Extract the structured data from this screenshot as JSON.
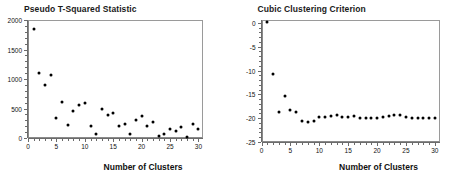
{
  "chart_data": [
    {
      "type": "scatter",
      "panel_id": "pseudo-t-squared",
      "title": "Pseudo T-Squared Statistic",
      "xlabel": "Number of Clusters",
      "ylabel": "",
      "xlim": [
        0,
        30.8
      ],
      "ylim": [
        0,
        2000
      ],
      "xticks": [
        0,
        5,
        10,
        15,
        20,
        25,
        30
      ],
      "xticklabels": [
        "0",
        "5",
        "10",
        "15",
        "20",
        "25",
        "30"
      ],
      "yticks": [
        0,
        500,
        1000,
        1500,
        2000
      ],
      "yticklabels": [
        "0",
        "500",
        "1000",
        "1500",
        "2000"
      ],
      "grid": false,
      "legend": "none",
      "x": [
        1,
        2,
        3,
        4,
        5,
        6,
        7,
        8,
        9,
        10,
        11,
        12,
        13,
        14,
        15,
        16,
        17,
        18,
        19,
        20,
        21,
        22,
        23,
        24,
        25,
        26,
        27,
        28,
        29,
        30
      ],
      "values": [
        1840,
        1100,
        890,
        1060,
        340,
        615,
        220,
        465,
        560,
        600,
        200,
        65,
        500,
        395,
        430,
        195,
        230,
        60,
        310,
        370,
        210,
        265,
        30,
        70,
        160,
        115,
        190,
        25,
        245,
        155
      ]
    },
    {
      "type": "scatter",
      "panel_id": "cubic-clustering-criterion",
      "title": "Cubic Clustering Criterion",
      "xlabel": "Number of Clusters",
      "ylabel": "",
      "xlim": [
        0,
        30.8
      ],
      "ylim": [
        -25,
        0.6
      ],
      "xticks": [
        0,
        5,
        10,
        15,
        20,
        25,
        30
      ],
      "xticklabels": [
        "0",
        "5",
        "10",
        "15",
        "20",
        "25",
        "30"
      ],
      "yticks": [
        0,
        -5,
        -10,
        -15,
        -20,
        -25
      ],
      "yticklabels": [
        "0",
        "-5",
        "-10",
        "-15",
        "-20",
        "-25"
      ],
      "grid": false,
      "legend": "none",
      "x": [
        1,
        2,
        3,
        4,
        5,
        6,
        7,
        8,
        9,
        10,
        11,
        12,
        13,
        14,
        15,
        16,
        17,
        18,
        19,
        20,
        21,
        22,
        23,
        24,
        25,
        26,
        27,
        28,
        29,
        30
      ],
      "values": [
        0.2,
        -10.8,
        -18.6,
        -15.4,
        -18.2,
        -18.8,
        -20.6,
        -20.8,
        -20.6,
        -19.7,
        -19.7,
        -19.6,
        -19.4,
        -19.7,
        -19.7,
        -19.6,
        -19.9,
        -20.0,
        -20.0,
        -19.9,
        -19.8,
        -19.6,
        -19.3,
        -19.4,
        -19.8,
        -19.9,
        -19.9,
        -20.0,
        -20.0,
        -19.9
      ]
    }
  ],
  "colors": {
    "marker": "#000000",
    "axis": "#6b6b6b",
    "frame": "#8a8a8a",
    "text": "#111111",
    "background": "#ffffff"
  }
}
